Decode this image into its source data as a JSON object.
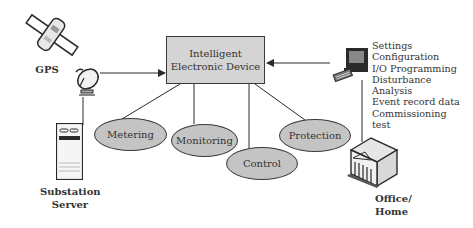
{
  "diagram": {
    "central_node": {
      "line1": "Intelligent",
      "line2": "Electronic Device"
    },
    "functions": [
      {
        "label": "Metering"
      },
      {
        "label": "Monitoring"
      },
      {
        "label": "Control"
      },
      {
        "label": "Protection"
      }
    ],
    "nodes": {
      "gps": {
        "label": "GPS",
        "icon": "satellite-icon"
      },
      "dish": {
        "icon": "satellite-dish-icon"
      },
      "server": {
        "line1": "Substation",
        "line2": "Server",
        "icon": "server-tower-icon"
      },
      "computer": {
        "icon": "desktop-computer-icon"
      },
      "office": {
        "line1": "Office/",
        "line2": "Home",
        "icon": "building-icon"
      }
    },
    "computer_functions": [
      "Settings",
      "Configuration",
      "I/O  Programming",
      "Disturbance",
      "Analysis",
      "Event  record data",
      "Commissioning",
      "test"
    ],
    "colors": {
      "box_fill": "#d4d4d4",
      "ellipse_fill": "#c4c4c4",
      "stroke": "#3a3a3a"
    }
  }
}
